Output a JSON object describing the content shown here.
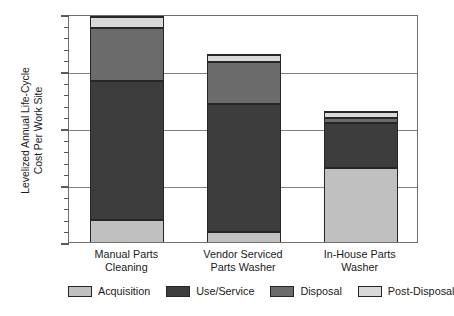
{
  "chart_data": {
    "type": "bar",
    "stacked": true,
    "title": "",
    "xlabel": "",
    "ylabel": "Levelized Annual Life-Cycle\nCost Per Work Site",
    "ylim": [
      0,
      2.0
    ],
    "ytick_labels": [
      "0",
      "0.5",
      "1.0",
      "1.5",
      "2.0"
    ],
    "ytick_values": [
      0,
      0.5,
      1.0,
      1.5,
      2.0
    ],
    "yminor_step": 0.1,
    "grid": "horizontal-major",
    "legend_position": "bottom",
    "categories": [
      "Manual Parts\nCleaning",
      "Vendor Serviced\nParts Washer",
      "In-House Parts\nWasher"
    ],
    "series": [
      {
        "name": "Acquisition",
        "color": "#c0c0c0",
        "values": [
          0.19,
          0.09,
          0.65
        ]
      },
      {
        "name": "Use/Service",
        "color": "#3d3d3d",
        "values": [
          1.23,
          1.13,
          0.4
        ]
      },
      {
        "name": "Disposal",
        "color": "#6b6b6b",
        "values": [
          0.47,
          0.37,
          0.05
        ]
      },
      {
        "name": "Post-Disposal",
        "color": "#d9d9d9",
        "values": [
          0.09,
          0.06,
          0.05
        ]
      }
    ],
    "totals": [
      1.98,
      1.65,
      1.15
    ],
    "colors": {
      "acquisition": "#c0c0c0",
      "use_service": "#3d3d3d",
      "disposal": "#6b6b6b",
      "post_disposal": "#d9d9d9",
      "outline": "#262626",
      "axis": "#6f6f6f",
      "grid": "#808080"
    }
  },
  "legend": {
    "items": [
      {
        "label": "Acquisition"
      },
      {
        "label": "Use/Service"
      },
      {
        "label": "Disposal"
      },
      {
        "label": "Post-Disposal"
      }
    ]
  }
}
